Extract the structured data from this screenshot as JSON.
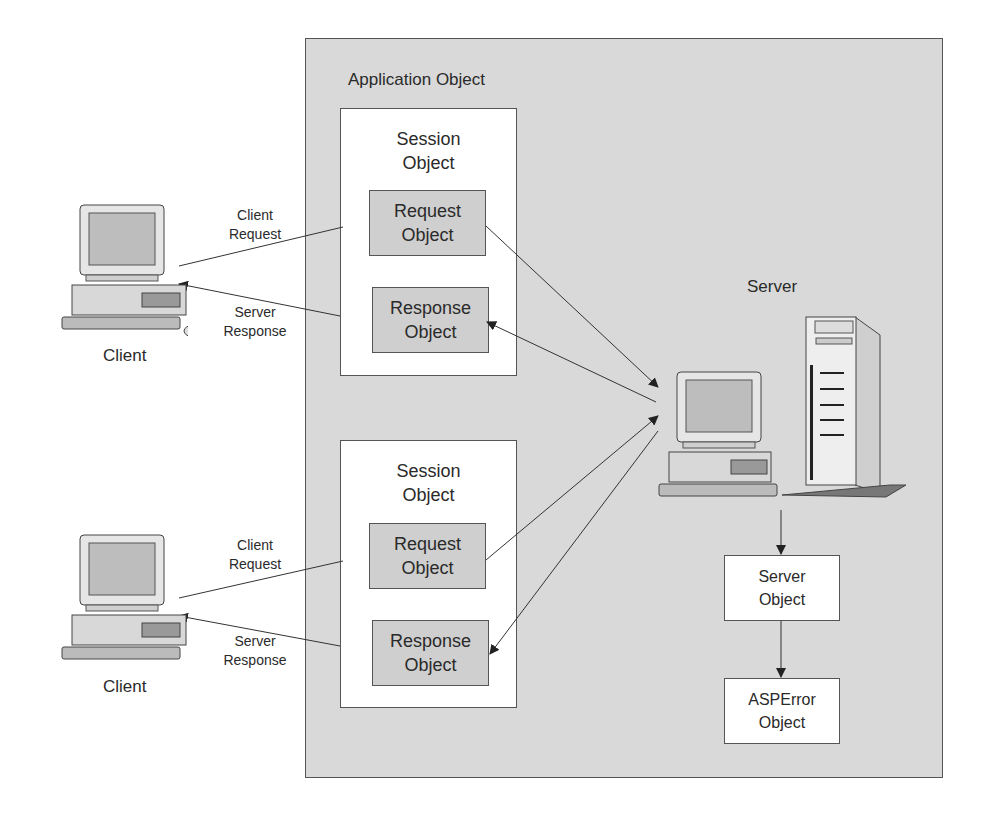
{
  "diagram": {
    "application": {
      "title": "Application Object"
    },
    "sessions": [
      {
        "title": "Session\nObject",
        "request": "Request\nObject",
        "response": "Response\nObject"
      },
      {
        "title": "Session\nObject",
        "request": "Request\nObject",
        "response": "Response\nObject"
      }
    ],
    "clients": [
      {
        "label": "Client",
        "request_label": "Client\nRequest",
        "response_label": "Server\nResponse"
      },
      {
        "label": "Client",
        "request_label": "Client\nRequest",
        "response_label": "Server\nResponse"
      }
    ],
    "server": {
      "label": "Server"
    },
    "server_object": "Server\nObject",
    "asperror_object": "ASPError\nObject"
  }
}
